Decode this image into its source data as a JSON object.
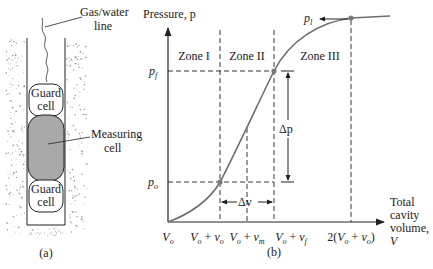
{
  "panel_a": {
    "caption": "(a)",
    "gas_water_line": [
      "Gas/water",
      "line"
    ],
    "guard_cell_top": [
      "Guard",
      "cell"
    ],
    "measuring_cell": [
      "Measuring",
      "cell"
    ],
    "guard_cell_bottom": [
      "Guard",
      "cell"
    ],
    "colors": {
      "measuring_fill": "#a9a9a9",
      "outline": "#222222",
      "soil_dots": "#9a9a9a"
    }
  },
  "panel_b": {
    "caption": "(b)",
    "y_axis_label": "Pressure, p",
    "x_axis_label": [
      "Total",
      "cavity",
      "volume,",
      "V"
    ],
    "zones": [
      "Zone I",
      "Zone II",
      "Zone III"
    ],
    "y_marks": {
      "p_f": "p",
      "p_f_sub": "f",
      "p_o": "p",
      "p_o_sub": "o",
      "p_l": "p",
      "p_l_sub": "l"
    },
    "x_ticks": [
      "V_o",
      "V_o + v_o",
      "V_o + v_m",
      "V_o + v_f",
      "2(V_o + v_o)"
    ],
    "x_tick_parts": [
      {
        "a": "V",
        "as": "o"
      },
      {
        "a": "V",
        "as": "o",
        "op": " + ",
        "b": "v",
        "bs": "o"
      },
      {
        "a": "V",
        "as": "o",
        "op": " + ",
        "b": "v",
        "bs": "m"
      },
      {
        "a": "V",
        "as": "o",
        "op": " + ",
        "b": "v",
        "bs": "f"
      },
      {
        "pre": "2(",
        "a": "V",
        "as": "o",
        "op": " + ",
        "b": "v",
        "bs": "o",
        "post": ")"
      }
    ],
    "delta_p": "Δp",
    "delta_v": "Δv",
    "colors": {
      "curve": "#6e6e6e",
      "axes": "#222222",
      "points": "#7a7a7a"
    }
  }
}
